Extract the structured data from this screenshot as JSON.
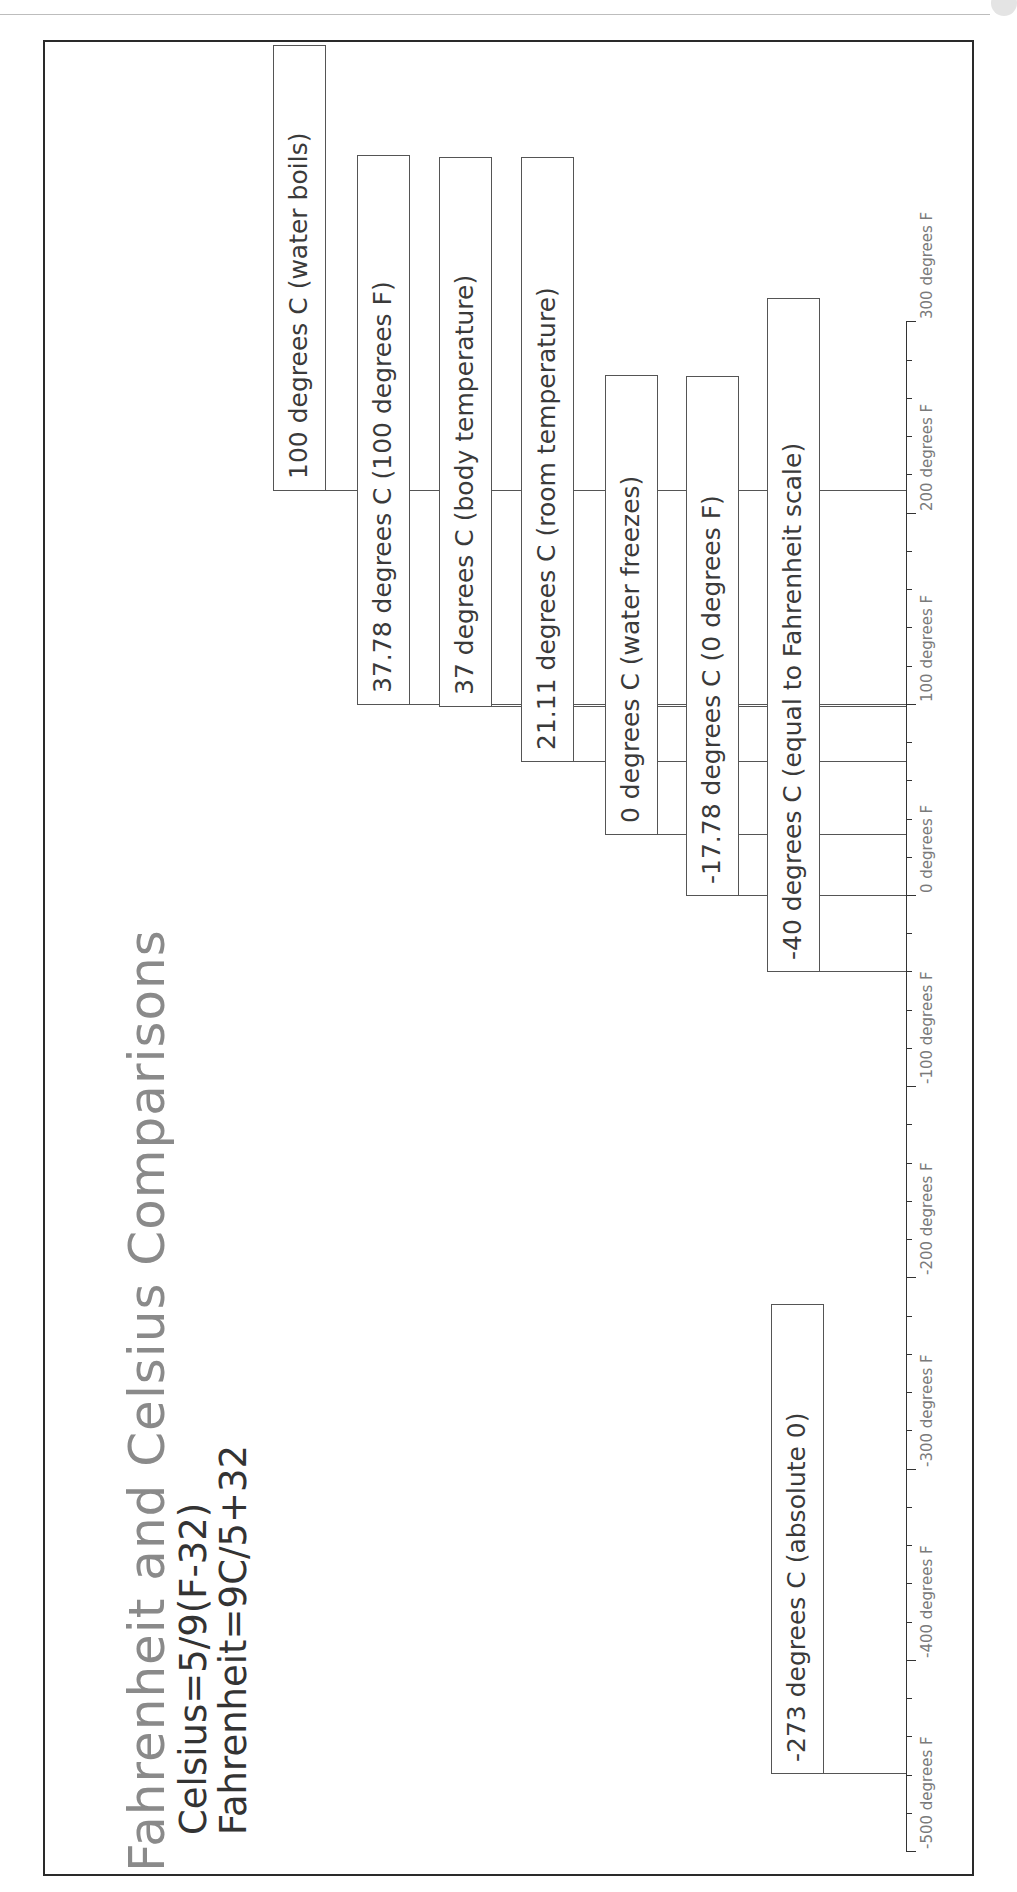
{
  "page": {
    "header_text": "",
    "title": "Fahrenheit and Celsius Comparisons",
    "formulas": {
      "celsius": "Celsius=5/9(F-32)",
      "fahrenheit": "Fahrenheit=9C/5+32"
    },
    "colors": {
      "title": "#8a8a8a",
      "text": "#3a3a3a",
      "axis": "#333333",
      "tick_label": "#7a7a7a"
    }
  },
  "axis": {
    "label_unit": "degrees F",
    "ticks": [
      {
        "value": 300,
        "label": "300 degrees F"
      },
      {
        "value": 200,
        "label": "200 degrees F"
      },
      {
        "value": 100,
        "label": "100 degrees F"
      },
      {
        "value": 0,
        "label": "0 degrees F"
      },
      {
        "value": -100,
        "label": "-100 degrees F"
      },
      {
        "value": -200,
        "label": "-200 degrees F"
      },
      {
        "value": -300,
        "label": "-300 degrees F"
      },
      {
        "value": -400,
        "label": "-400 degrees F"
      },
      {
        "value": -500,
        "label": "-500 degrees F"
      }
    ],
    "minor_ticks_per_major": 4,
    "range": [
      -500,
      300
    ]
  },
  "markers": [
    {
      "label": "100 degrees C (water boils)",
      "celsius": 100,
      "fahrenheit": 212
    },
    {
      "label": "37.78 degrees C (100 degrees F)",
      "celsius": 37.78,
      "fahrenheit": 100
    },
    {
      "label": "37 degrees C (body temperature)",
      "celsius": 37,
      "fahrenheit": 98.6
    },
    {
      "label": "21.11 degrees C (room temperature)",
      "celsius": 21.11,
      "fahrenheit": 70
    },
    {
      "label": "0 degrees C (water freezes)",
      "celsius": 0,
      "fahrenheit": 32
    },
    {
      "label": "-17.78 degrees C (0 degrees F)",
      "celsius": -17.78,
      "fahrenheit": 0
    },
    {
      "label": "-40 degrees C (equal to Fahrenheit scale)",
      "celsius": -40,
      "fahrenheit": -40
    },
    {
      "label": "-273 degrees C (absolute 0)",
      "celsius": -273,
      "fahrenheit": -459.4
    }
  ]
}
